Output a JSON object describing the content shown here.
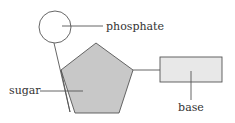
{
  "diagram": {
    "labels": {
      "phosphate": "phosphate",
      "sugar": "sugar",
      "base": "base"
    },
    "colors": {
      "stroke": "#555555",
      "sugar_fill": "#c8c8c8",
      "base_fill": "#e8e8e8",
      "phosphate_fill": "#ffffff",
      "text": "#333333"
    }
  }
}
